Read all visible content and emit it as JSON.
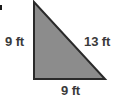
{
  "figure": {
    "kind": "right-triangle-geometry-figure",
    "shape_name": "right triangle",
    "background_color": "#ffffff",
    "fill_color": "#8c8c8c",
    "stroke_color": "#2a2a2a",
    "stroke_width": 2,
    "label_color": "#3a3a3a",
    "vertices": {
      "apex": [
        34,
        2
      ],
      "bottom_left": [
        34,
        79
      ],
      "bottom_right": [
        105,
        79
      ]
    },
    "labels": {
      "left_leg": "9 ft",
      "hypotenuse": "13 ft",
      "base": "9 ft"
    },
    "measurements": [
      {
        "side": "left-leg",
        "value": 9,
        "unit": "ft",
        "text": "9 ft"
      },
      {
        "side": "hypotenuse",
        "value": 13,
        "unit": "ft",
        "text": "13 ft"
      },
      {
        "side": "base",
        "value": 9,
        "unit": "ft",
        "text": "9 ft"
      }
    ]
  }
}
